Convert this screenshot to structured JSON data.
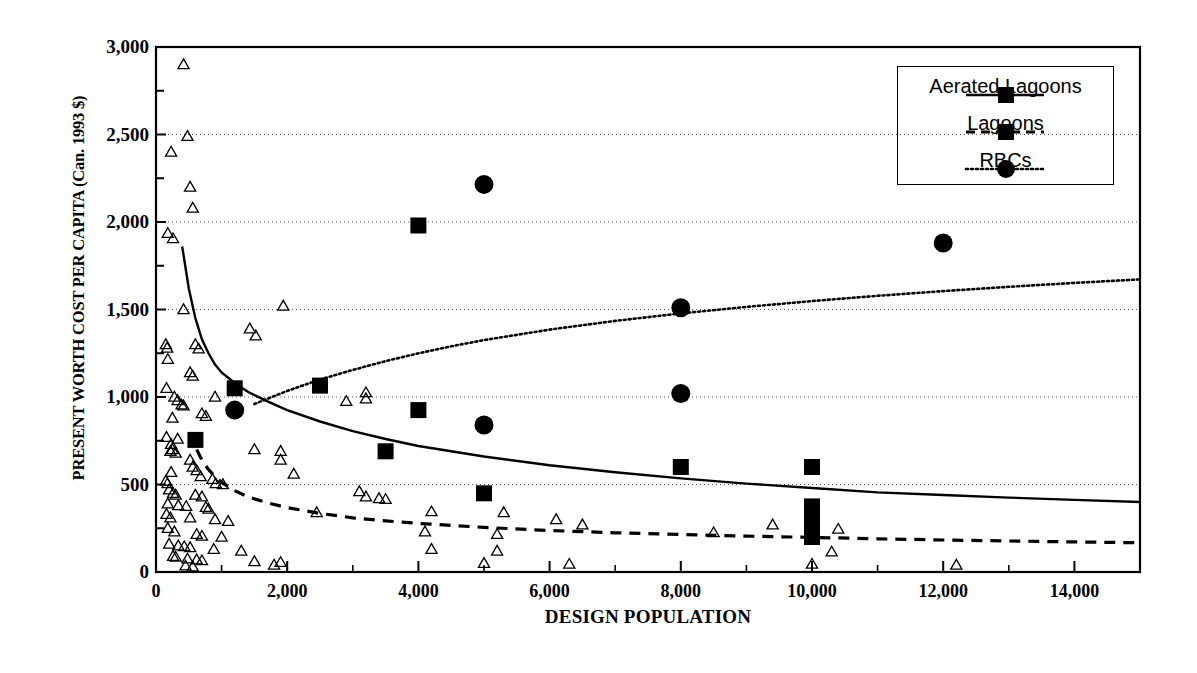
{
  "chart_data": {
    "type": "scatter",
    "title": "",
    "xlabel": "DESIGN POPULATION",
    "ylabel": "PRESENT WORTH COST PER CAPITA (Can. 1993 $)",
    "xlim": [
      0,
      15000
    ],
    "ylim": [
      0,
      3000
    ],
    "x_ticks": [
      0,
      2000,
      4000,
      6000,
      8000,
      10000,
      12000,
      14000
    ],
    "x_tick_labels": [
      "0",
      "2,000",
      "4,000",
      "6,000",
      "8,000",
      "10,000",
      "12,000",
      "14,000"
    ],
    "x_minor_ticks": [
      1000,
      3000,
      5000,
      7000,
      9000,
      11000,
      13000,
      15000
    ],
    "y_ticks": [
      0,
      500,
      1000,
      1500,
      2000,
      2500,
      3000
    ],
    "y_tick_labels": [
      "0",
      "500",
      "1,000",
      "1,500",
      "2,000",
      "2,500",
      "3,000"
    ],
    "y_minor_ticks": [
      250,
      750,
      1250,
      1750,
      2250,
      2750
    ],
    "grid": "horizontal-dotted",
    "legend_position": "top-right",
    "series": [
      {
        "name": "Aerated Lagoons",
        "marker": "filled-square",
        "line": "solid",
        "points": [
          [
            600,
            755
          ],
          [
            1200,
            1050
          ],
          [
            2500,
            1065
          ],
          [
            3500,
            690
          ],
          [
            4000,
            1980
          ],
          [
            4000,
            925
          ],
          [
            5000,
            450
          ],
          [
            8000,
            600
          ],
          [
            10000,
            600
          ],
          [
            10000,
            375
          ],
          [
            10000,
            310
          ],
          [
            10000,
            240
          ],
          [
            10000,
            200
          ]
        ]
      },
      {
        "name": "Lagoons",
        "marker": "open-triangle",
        "line": "dashed",
        "points": [
          [
            420,
            2900
          ],
          [
            480,
            2490
          ],
          [
            230,
            2400
          ],
          [
            520,
            2200
          ],
          [
            560,
            2080
          ],
          [
            180,
            1935
          ],
          [
            260,
            1905
          ],
          [
            420,
            1500
          ],
          [
            1940,
            1520
          ],
          [
            1520,
            1350
          ],
          [
            150,
            1300
          ],
          [
            170,
            1280
          ],
          [
            600,
            1300
          ],
          [
            650,
            1275
          ],
          [
            180,
            1215
          ],
          [
            1430,
            1390
          ],
          [
            520,
            1140
          ],
          [
            560,
            1120
          ],
          [
            160,
            1050
          ],
          [
            900,
            1000
          ],
          [
            280,
            1000
          ],
          [
            330,
            980
          ],
          [
            2900,
            975
          ],
          [
            390,
            955
          ],
          [
            420,
            950
          ],
          [
            700,
            905
          ],
          [
            760,
            890
          ],
          [
            250,
            880
          ],
          [
            3200,
            1025
          ],
          [
            3200,
            990
          ],
          [
            160,
            770
          ],
          [
            330,
            760
          ],
          [
            230,
            730
          ],
          [
            250,
            700
          ],
          [
            220,
            690
          ],
          [
            300,
            680
          ],
          [
            520,
            640
          ],
          [
            560,
            600
          ],
          [
            1500,
            700
          ],
          [
            1900,
            690
          ],
          [
            1900,
            640
          ],
          [
            230,
            570
          ],
          [
            620,
            580
          ],
          [
            680,
            545
          ],
          [
            2100,
            560
          ],
          [
            150,
            520
          ],
          [
            175,
            505
          ],
          [
            860,
            530
          ],
          [
            910,
            505
          ],
          [
            1020,
            500
          ],
          [
            3100,
            460
          ],
          [
            3200,
            430
          ],
          [
            3400,
            420
          ],
          [
            3500,
            415
          ],
          [
            200,
            470
          ],
          [
            260,
            450
          ],
          [
            300,
            440
          ],
          [
            600,
            440
          ],
          [
            700,
            430
          ],
          [
            180,
            390
          ],
          [
            340,
            380
          ],
          [
            460,
            375
          ],
          [
            760,
            370
          ],
          [
            800,
            360
          ],
          [
            2450,
            340
          ],
          [
            4200,
            345
          ],
          [
            5300,
            340
          ],
          [
            6100,
            300
          ],
          [
            6500,
            270
          ],
          [
            160,
            330
          ],
          [
            220,
            310
          ],
          [
            520,
            310
          ],
          [
            900,
            300
          ],
          [
            1100,
            290
          ],
          [
            180,
            250
          ],
          [
            280,
            230
          ],
          [
            620,
            215
          ],
          [
            700,
            205
          ],
          [
            1000,
            200
          ],
          [
            4100,
            230
          ],
          [
            5200,
            215
          ],
          [
            8500,
            225
          ],
          [
            9400,
            270
          ],
          [
            10400,
            245
          ],
          [
            200,
            160
          ],
          [
            340,
            150
          ],
          [
            430,
            145
          ],
          [
            520,
            140
          ],
          [
            880,
            130
          ],
          [
            1300,
            120
          ],
          [
            4200,
            130
          ],
          [
            5200,
            120
          ],
          [
            10300,
            115
          ],
          [
            260,
            90
          ],
          [
            300,
            85
          ],
          [
            480,
            75
          ],
          [
            620,
            70
          ],
          [
            700,
            65
          ],
          [
            1500,
            60
          ],
          [
            1900,
            55
          ],
          [
            5000,
            50
          ],
          [
            6300,
            45
          ],
          [
            10000,
            45
          ],
          [
            12200,
            40
          ],
          [
            1800,
            40
          ],
          [
            450,
            35
          ],
          [
            560,
            30
          ]
        ]
      },
      {
        "name": "RBCs",
        "marker": "filled-circle",
        "line": "dotted",
        "points": [
          [
            1200,
            925
          ],
          [
            5000,
            2215
          ],
          [
            5000,
            840
          ],
          [
            8000,
            1510
          ],
          [
            8000,
            1020
          ],
          [
            12000,
            1880
          ]
        ]
      }
    ],
    "fitted_curves": [
      {
        "name": "Aerated Lagoons trend",
        "style": "solid",
        "points": [
          [
            400,
            1860
          ],
          [
            500,
            1620
          ],
          [
            600,
            1450
          ],
          [
            700,
            1330
          ],
          [
            800,
            1250
          ],
          [
            900,
            1185
          ],
          [
            1000,
            1140
          ],
          [
            1200,
            1080
          ],
          [
            1400,
            1030
          ],
          [
            1700,
            975
          ],
          [
            2000,
            925
          ],
          [
            2500,
            860
          ],
          [
            3000,
            805
          ],
          [
            3500,
            760
          ],
          [
            4000,
            720
          ],
          [
            5000,
            660
          ],
          [
            6000,
            610
          ],
          [
            7000,
            570
          ],
          [
            8000,
            535
          ],
          [
            9000,
            505
          ],
          [
            10000,
            480
          ],
          [
            11000,
            455
          ],
          [
            12000,
            440
          ],
          [
            13000,
            425
          ],
          [
            14000,
            412
          ],
          [
            15000,
            400
          ]
        ]
      },
      {
        "name": "Lagoons trend",
        "style": "dashed",
        "points": [
          [
            620,
            700
          ],
          [
            700,
            640
          ],
          [
            800,
            585
          ],
          [
            900,
            545
          ],
          [
            1000,
            512
          ],
          [
            1200,
            465
          ],
          [
            1400,
            430
          ],
          [
            1700,
            395
          ],
          [
            2000,
            368
          ],
          [
            2500,
            335
          ],
          [
            3000,
            310
          ],
          [
            3500,
            292
          ],
          [
            4000,
            278
          ],
          [
            5000,
            255
          ],
          [
            6000,
            237
          ],
          [
            7000,
            224
          ],
          [
            8000,
            214
          ],
          [
            9000,
            205
          ],
          [
            10000,
            198
          ],
          [
            11000,
            190
          ],
          [
            12000,
            183
          ],
          [
            13000,
            177
          ],
          [
            14000,
            172
          ],
          [
            15000,
            167
          ]
        ]
      },
      {
        "name": "RBCs trend",
        "style": "dotted",
        "points": [
          [
            1500,
            960
          ],
          [
            2000,
            1035
          ],
          [
            2500,
            1100
          ],
          [
            3000,
            1155
          ],
          [
            3500,
            1205
          ],
          [
            4000,
            1250
          ],
          [
            4500,
            1290
          ],
          [
            5000,
            1325
          ],
          [
            6000,
            1385
          ],
          [
            7000,
            1435
          ],
          [
            8000,
            1478
          ],
          [
            9000,
            1515
          ],
          [
            10000,
            1548
          ],
          [
            11000,
            1578
          ],
          [
            12000,
            1605
          ],
          [
            13000,
            1630
          ],
          [
            14000,
            1652
          ],
          [
            15000,
            1672
          ]
        ]
      }
    ]
  },
  "legend": {
    "items": [
      {
        "label": "Aerated Lagoons",
        "marker": "filled-square",
        "line": "solid"
      },
      {
        "label": "Lagoons",
        "marker": "filled-square",
        "line": "dashed"
      },
      {
        "label": "RBCs",
        "marker": "filled-circle",
        "line": "dotted"
      }
    ]
  }
}
